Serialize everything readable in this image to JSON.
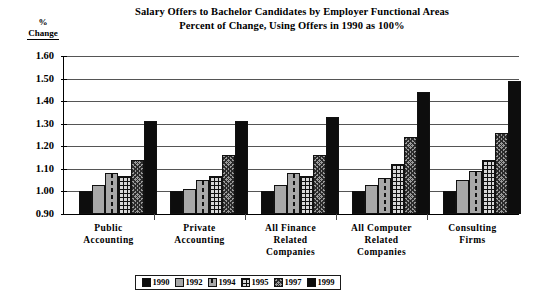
{
  "chart_data": {
    "type": "bar",
    "title": "Salary Offers to Bachelor Candidates by Employer Functional Areas",
    "subtitle": "Percent of Change, Using Offers in 1990 as 100%",
    "ylabel_line1": "%",
    "ylabel_line2": "Change",
    "xlabel": "",
    "ylim": [
      0.9,
      1.6
    ],
    "ytick_labels": [
      "1.60",
      "1.50",
      "1.40",
      "1.30",
      "1.20",
      "1.10",
      "1.00",
      "0.90"
    ],
    "ytick_values": [
      1.6,
      1.5,
      1.4,
      1.3,
      1.2,
      1.1,
      1.0,
      0.9
    ],
    "grid": true,
    "legend_position": "bottom",
    "categories": [
      "Public Accounting",
      "Private Accounting",
      "All Finance Related Companies",
      "All Computer Related Companies",
      "Consulting Firms"
    ],
    "category_labels": [
      [
        "Public",
        "Accounting"
      ],
      [
        "Private",
        "Accounting"
      ],
      [
        "All Finance",
        "Related",
        "Companies"
      ],
      [
        "All Computer",
        "Related",
        "Companies"
      ],
      [
        "Consulting",
        "Firms"
      ]
    ],
    "series": [
      {
        "name": "1990",
        "pattern": "solid-black",
        "values": [
          1.0,
          1.0,
          1.0,
          1.0,
          1.0
        ]
      },
      {
        "name": "1992",
        "pattern": "light-gray",
        "values": [
          1.03,
          1.01,
          1.03,
          1.03,
          1.05
        ]
      },
      {
        "name": "1994",
        "pattern": "gray-dashed",
        "values": [
          1.08,
          1.05,
          1.08,
          1.06,
          1.09
        ]
      },
      {
        "name": "1995",
        "pattern": "grid-hatch",
        "values": [
          1.07,
          1.07,
          1.07,
          1.12,
          1.14
        ]
      },
      {
        "name": "1997",
        "pattern": "stipple-gray",
        "values": [
          1.14,
          1.16,
          1.16,
          1.24,
          1.26
        ]
      },
      {
        "name": "1999",
        "pattern": "solid-black",
        "values": [
          1.31,
          1.31,
          1.33,
          1.44,
          1.49
        ]
      }
    ]
  }
}
